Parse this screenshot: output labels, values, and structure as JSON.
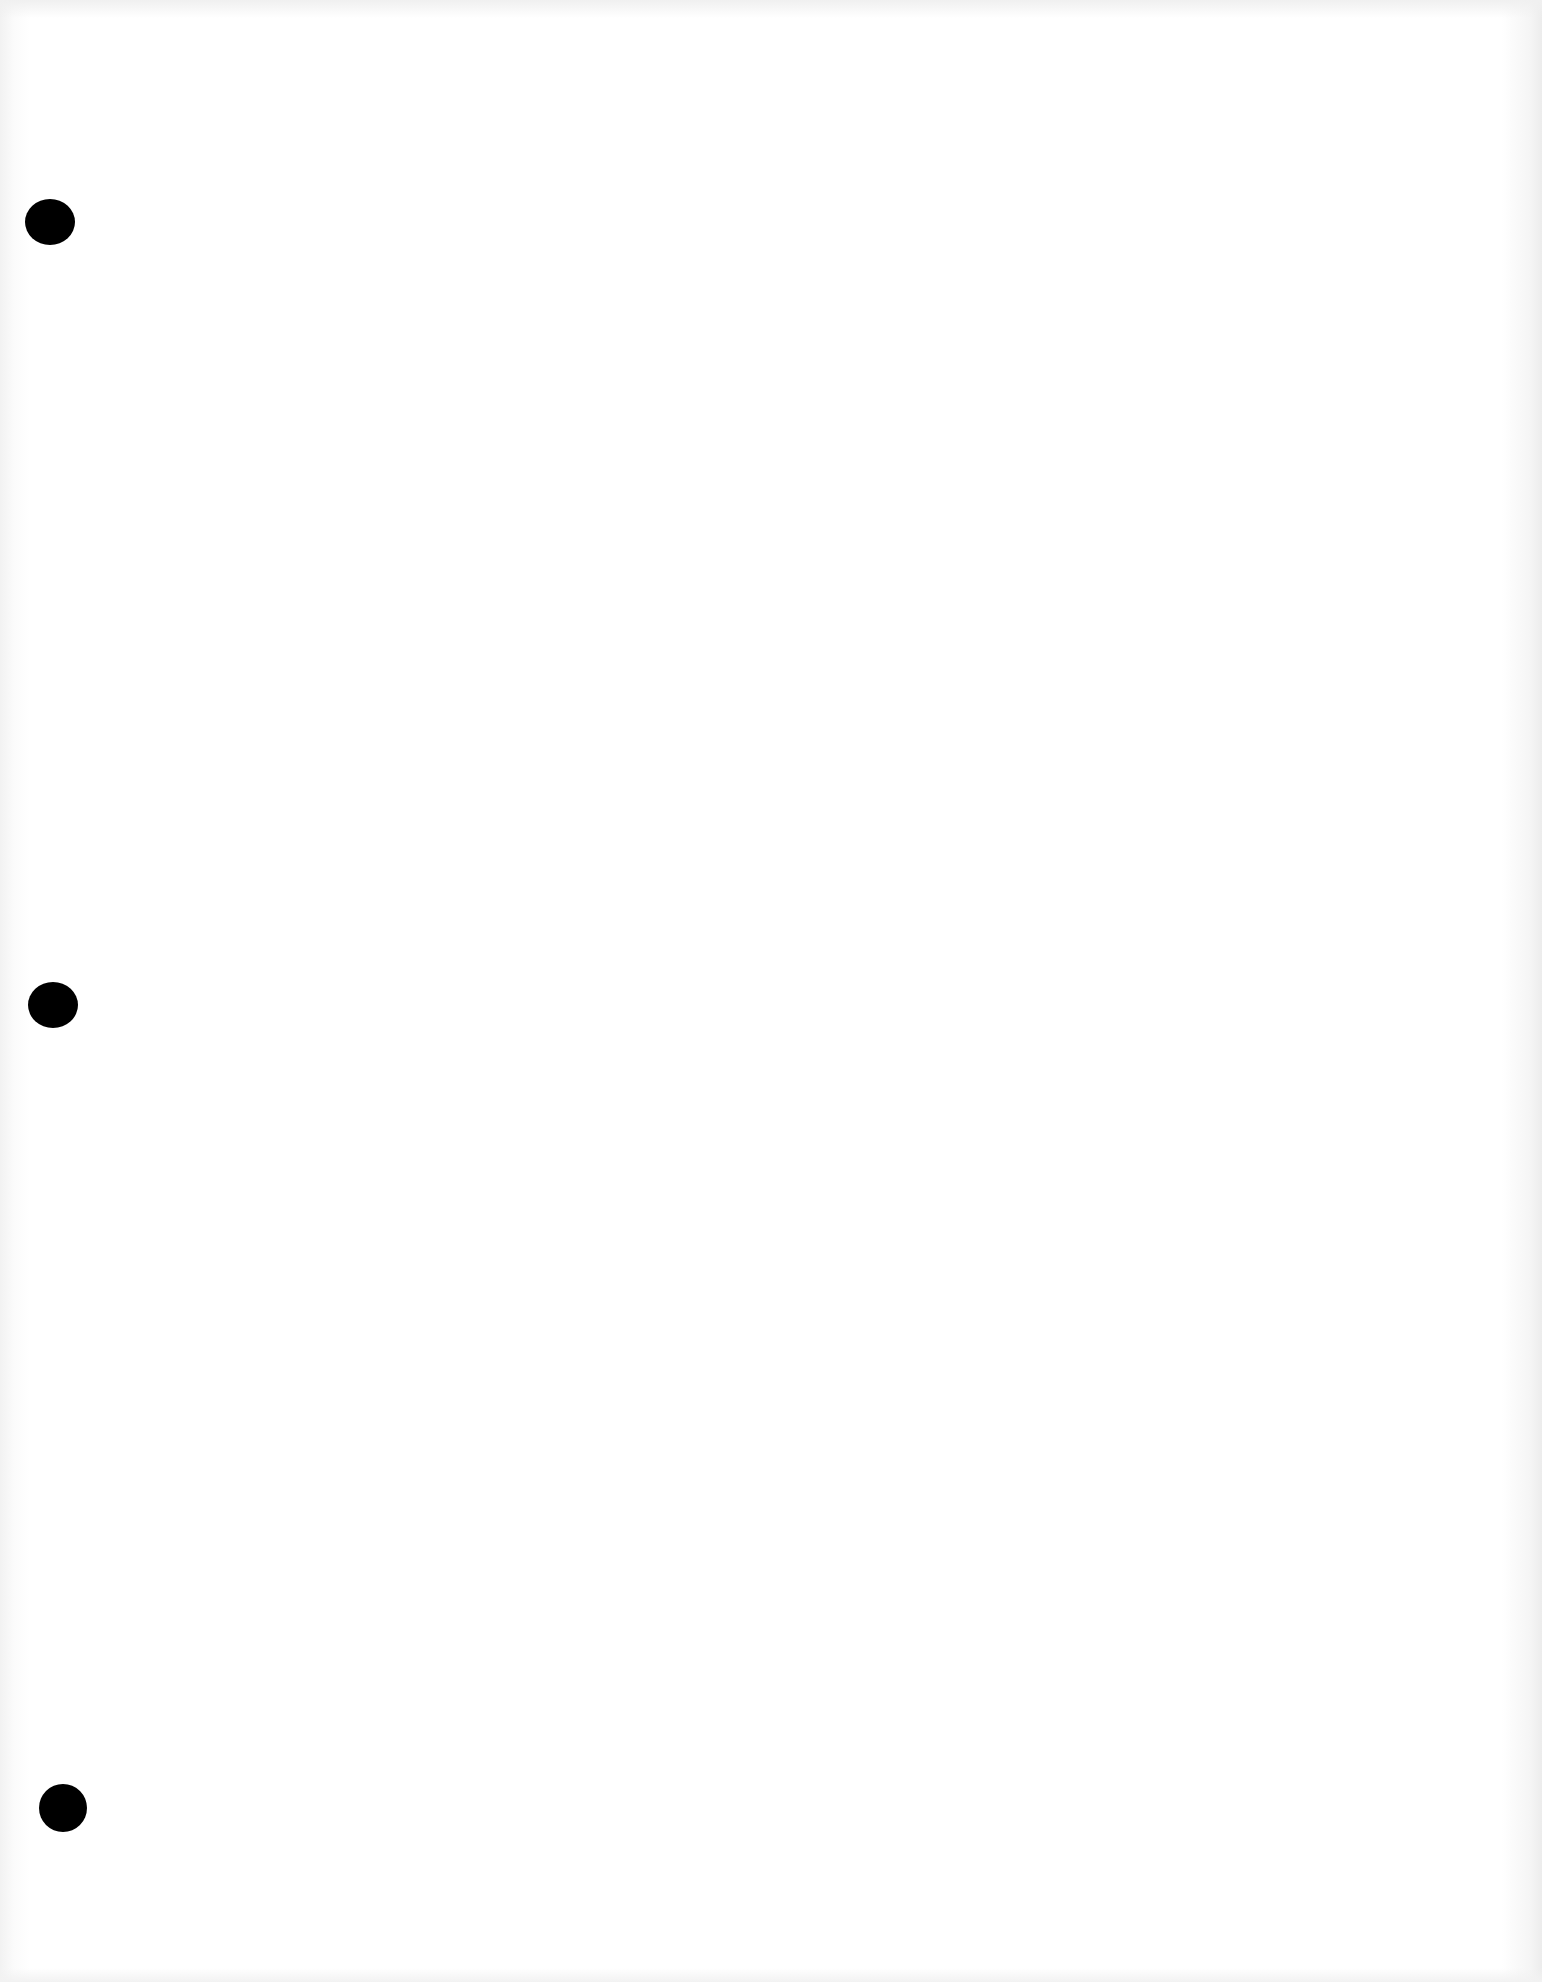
{
  "document": {
    "type": "blank scanned page",
    "background_color": "#ffffff",
    "hole_color": "#000000",
    "punch_holes": [
      {
        "cx": 50,
        "cy": 222,
        "w": 50,
        "h": 46
      },
      {
        "cx": 53,
        "cy": 1005,
        "w": 50,
        "h": 46
      },
      {
        "cx": 63,
        "cy": 1808,
        "w": 48,
        "h": 48
      }
    ]
  }
}
